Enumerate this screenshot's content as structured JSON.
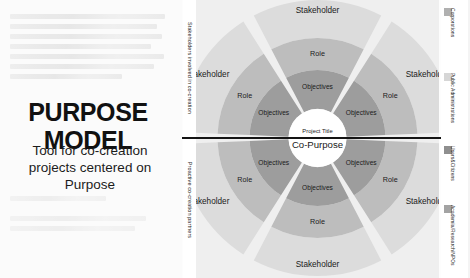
{
  "left_panel": {
    "title": "PURPOSE MODEL",
    "subtitle": "Tool for co-creation projects centered on Purpose"
  },
  "axis_labels": {
    "top": "Stakeholders involved in co-creation",
    "bottom": "Proactive co-creation partners"
  },
  "diagram": {
    "center": {
      "project_title_label": "Project Title",
      "project_name": "Co-Purpose"
    },
    "ring_labels": {
      "outer": "Stakeholder",
      "middle": "Role",
      "inner": "Objectives"
    },
    "sectors": [
      {
        "id": "top-left",
        "stakeholder": "Stakeholder",
        "role": "Role",
        "objectives": "Objectives"
      },
      {
        "id": "top-center",
        "stakeholder": "Stakeholder",
        "role": "Role",
        "objectives": "Objectives"
      },
      {
        "id": "top-right",
        "stakeholder": "Stakeholder",
        "role": "Role",
        "objectives": "Objectives"
      },
      {
        "id": "bottom-left",
        "stakeholder": "Stakeholder",
        "role": "Role",
        "objectives": "Objectives"
      },
      {
        "id": "bottom-center",
        "stakeholder": "Stakeholder",
        "role": "Role",
        "objectives": "Objectives"
      },
      {
        "id": "bottom-right",
        "stakeholder": "Stakeholder",
        "role": "Role",
        "objectives": "Objectives"
      }
    ],
    "colors": {
      "background": "#efefef",
      "ring_outer": "#dcdcdc",
      "ring_middle": "#bdbdbd",
      "ring_inner": "#9d9d9d",
      "center": "#ffffff",
      "gap": "#eeeeee",
      "divider": "#141414"
    }
  },
  "legend": {
    "items": [
      {
        "label": "Corporations",
        "color": "#b0b0b0"
      },
      {
        "label": "Public Administrations",
        "color": "#d6d6d6"
      },
      {
        "label": "Users&Citizens",
        "color": "#8f8f8f"
      },
      {
        "label": "Academia/Research/NPOs",
        "color": "#a3a3a3"
      }
    ]
  }
}
